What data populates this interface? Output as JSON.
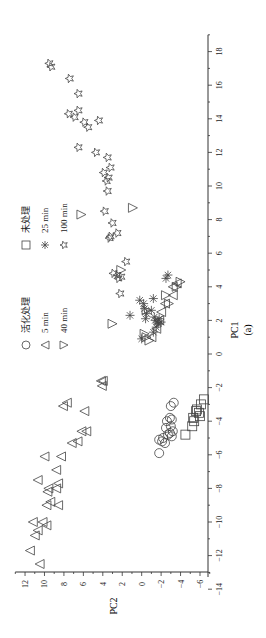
{
  "chart_data": {
    "type": "scatter",
    "orientation": "rotated-90-ccw",
    "title": "",
    "caption": "(a)",
    "xlabel": "PC1",
    "ylabel": "PC2",
    "xlim": [
      -14,
      19
    ],
    "ylim": [
      -7,
      13
    ],
    "xticks": [
      -14,
      -12,
      -10,
      -8,
      -6,
      -4,
      -2,
      0,
      2,
      4,
      6,
      8,
      10,
      12,
      14,
      16,
      18
    ],
    "yticks": [
      -6,
      -4,
      -2,
      0,
      2,
      4,
      6,
      8,
      10,
      12
    ],
    "grid": false,
    "legend_position": "upper-left",
    "legend": [
      {
        "name": "活化处理",
        "marker": "circle"
      },
      {
        "name": "未处理",
        "marker": "square"
      },
      {
        "name": "5 min",
        "marker": "triangle-left"
      },
      {
        "name": "25 min",
        "marker": "asterisk"
      },
      {
        "name": "40 min",
        "marker": "triangle-down"
      },
      {
        "name": "100 min",
        "marker": "star"
      }
    ],
    "series": [
      {
        "name": "活化处理",
        "marker": "circle",
        "points": [
          [
            -2.9,
            -3.3
          ],
          [
            -3.1,
            -3.0
          ],
          [
            -3.8,
            -2.9
          ],
          [
            -4.0,
            -2.6
          ],
          [
            -4.3,
            -3.0
          ],
          [
            -4.6,
            -3.2
          ],
          [
            -4.8,
            -2.7
          ],
          [
            -5.0,
            -2.2
          ],
          [
            -5.1,
            -1.8
          ],
          [
            -5.3,
            -2.4
          ],
          [
            -4.9,
            -3.1
          ],
          [
            -4.4,
            -2.5
          ],
          [
            -5.2,
            -2.1
          ],
          [
            -5.9,
            -1.8
          ],
          [
            -4.7,
            -2.9
          ],
          [
            -3.9,
            -3.1
          ]
        ]
      },
      {
        "name": "未处理",
        "marker": "square",
        "points": [
          [
            -2.7,
            -6.4
          ],
          [
            -3.0,
            -6.1
          ],
          [
            -3.3,
            -5.7
          ],
          [
            -3.5,
            -5.9
          ],
          [
            -3.8,
            -5.3
          ],
          [
            -4.0,
            -5.4
          ],
          [
            -4.3,
            -5.2
          ],
          [
            -4.8,
            -4.5
          ],
          [
            -3.4,
            -5.6
          ],
          [
            -3.7,
            -6.0
          ]
        ]
      },
      {
        "name": "5 min",
        "marker": "triangle-left",
        "points": [
          [
            -12.5,
            10.5
          ],
          [
            -11.7,
            11.5
          ],
          [
            -10.8,
            11.0
          ],
          [
            -10.5,
            10.7
          ],
          [
            -10.2,
            9.8
          ],
          [
            -10.0,
            11.2
          ],
          [
            -10.0,
            10.2
          ],
          [
            -9.0,
            9.8
          ],
          [
            -9.0,
            8.6
          ],
          [
            -8.8,
            9.4
          ],
          [
            -8.2,
            9.7
          ],
          [
            -8.0,
            9.6
          ],
          [
            -8.0,
            8.8
          ],
          [
            -7.7,
            8.6
          ],
          [
            -7.5,
            10.7
          ],
          [
            -6.9,
            8.8
          ],
          [
            -6.1,
            8.3
          ],
          [
            -6.1,
            10.0
          ],
          [
            -5.3,
            7.2
          ],
          [
            -5.2,
            6.6
          ],
          [
            -4.6,
            6.2
          ],
          [
            -4.6,
            5.7
          ],
          [
            -3.4,
            5.9
          ],
          [
            -3.1,
            8.1
          ],
          [
            -2.9,
            7.7
          ],
          [
            -1.6,
            4.2
          ],
          [
            -1.9,
            4.1
          ],
          [
            -1.6,
            4.0
          ],
          [
            2.5,
            -2.0
          ],
          [
            3.0,
            -2.4
          ],
          [
            4.0,
            -3.2
          ],
          [
            4.2,
            -3.6
          ],
          [
            3.5,
            -3.2
          ],
          [
            1.5,
            -1.5
          ],
          [
            1.0,
            -1.0
          ],
          [
            2.0,
            -1.8
          ]
        ]
      },
      {
        "name": "25 min",
        "marker": "asterisk",
        "points": [
          [
            0.9,
            0.0
          ],
          [
            1.3,
            -1.2
          ],
          [
            1.6,
            -1.5
          ],
          [
            1.9,
            -2.0
          ],
          [
            2.1,
            -1.8
          ],
          [
            2.3,
            1.2
          ],
          [
            2.1,
            -0.4
          ],
          [
            2.4,
            -0.5
          ],
          [
            2.7,
            -0.3
          ],
          [
            3.0,
            -0.2
          ],
          [
            3.2,
            0.2
          ],
          [
            1.9,
            -1.6
          ],
          [
            2.0,
            -1.4
          ],
          [
            1.8,
            -1.7
          ],
          [
            2.2,
            -1.3
          ],
          [
            2.6,
            -1.0
          ],
          [
            3.3,
            -1.2
          ],
          [
            4.5,
            -2.5
          ],
          [
            4.7,
            -2.7
          ]
        ]
      },
      {
        "name": "40 min",
        "marker": "triangle-down",
        "points": [
          [
            8.3,
            6.2
          ],
          [
            8.7,
            0.9
          ],
          [
            5.0,
            2.1
          ],
          [
            1.8,
            3.0
          ],
          [
            1.0,
            -0.5
          ],
          [
            0.8,
            -0.8
          ],
          [
            1.2,
            -0.3
          ],
          [
            2.6,
            -0.5
          ],
          [
            3.0,
            -2.8
          ],
          [
            3.5,
            -2.5
          ],
          [
            4.0,
            -3.6
          ],
          [
            4.3,
            -4.0
          ]
        ]
      },
      {
        "name": "100 min",
        "marker": "star",
        "points": [
          [
            17.3,
            9.5
          ],
          [
            17.1,
            9.3
          ],
          [
            16.4,
            7.4
          ],
          [
            15.5,
            6.5
          ],
          [
            14.5,
            6.5
          ],
          [
            14.3,
            7.5
          ],
          [
            14.1,
            6.9
          ],
          [
            13.9,
            4.4
          ],
          [
            13.8,
            5.9
          ],
          [
            13.5,
            5.5
          ],
          [
            12.3,
            6.5
          ],
          [
            12.0,
            4.7
          ],
          [
            11.7,
            3.5
          ],
          [
            11.1,
            3.2
          ],
          [
            10.8,
            3.9
          ],
          [
            10.5,
            3.4
          ],
          [
            10.3,
            3.6
          ],
          [
            9.7,
            3.5
          ],
          [
            8.5,
            3.8
          ],
          [
            7.8,
            3.0
          ],
          [
            7.2,
            2.5
          ],
          [
            7.0,
            3.2
          ],
          [
            6.9,
            3.3
          ],
          [
            5.5,
            1.6
          ],
          [
            4.7,
            2.5
          ],
          [
            4.5,
            2.4
          ],
          [
            4.8,
            2.9
          ],
          [
            4.6,
            2.1
          ],
          [
            3.6,
            2.2
          ]
        ]
      }
    ]
  }
}
